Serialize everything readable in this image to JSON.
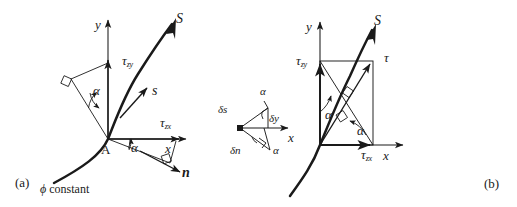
{
  "figure": {
    "kind": "technical-line-diagram",
    "width": 517,
    "height": 207,
    "background_color": "#ffffff",
    "line_color": "#1a1a1a",
    "text_color": "#1a1a1a"
  },
  "panel_a": {
    "caption": "(a)",
    "axes": {
      "y_label": "y",
      "x_label": "x"
    },
    "origin_label": "A",
    "contour_label_symbol": "ϕ",
    "contour_label_text": "constant",
    "curve_label": "S",
    "tangent_label": "s",
    "normal_label": "n",
    "stress_labels": [
      {
        "symbol": "τ",
        "subscript": "zy",
        "name": "tau-zy"
      },
      {
        "symbol": "τ",
        "subscript": "zx",
        "name": "tau-zx"
      }
    ],
    "angle_labels": [
      {
        "symbol": "α",
        "name": "alpha-upper"
      },
      {
        "symbol": "α",
        "name": "alpha-lower"
      }
    ]
  },
  "inset": {
    "name": "differential-element",
    "axis_label": "x",
    "labels": [
      {
        "text": "α",
        "name": "alpha-top"
      },
      {
        "text": "δs",
        "name": "delta-s"
      },
      {
        "text": "δy",
        "name": "delta-y"
      },
      {
        "text": "δn",
        "name": "delta-n"
      },
      {
        "text": "α",
        "name": "alpha-bottom"
      }
    ]
  },
  "panel_b": {
    "caption": "(b)",
    "axes": {
      "y_label": "y",
      "x_label": "x"
    },
    "curve_label": "S",
    "resultant_label": "τ",
    "stress_labels": [
      {
        "symbol": "τ",
        "subscript": "zy",
        "name": "tau-zy"
      },
      {
        "symbol": "τ",
        "subscript": "zx",
        "name": "tau-zx"
      }
    ],
    "angle_labels": [
      {
        "symbol": "α",
        "name": "alpha-left"
      },
      {
        "symbol": "α",
        "name": "alpha-bottom"
      }
    ]
  }
}
